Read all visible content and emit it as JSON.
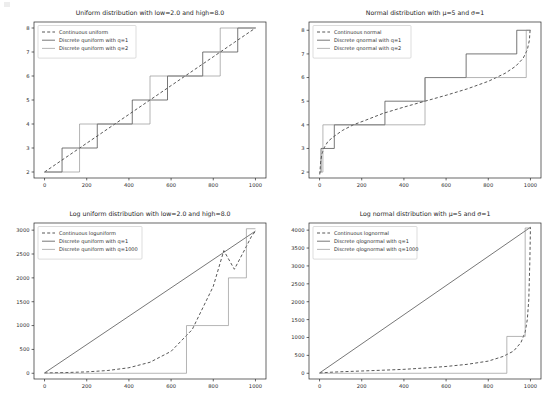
{
  "figure": {
    "width": 550,
    "height": 402,
    "background": "#ffffff",
    "rows": 2,
    "cols": 2
  },
  "style": {
    "continuous_color": "#3a3a3a",
    "q1_color": "#4a4a4a",
    "q2_color": "#8d8d8d",
    "axis_color": "#262626"
  },
  "chart_data": [
    {
      "id": "uniform",
      "type": "line",
      "title": "Uniform distribution with low=2.0 and high=8.0",
      "xlabel": "",
      "ylabel": "",
      "xlim": [
        -50,
        1050
      ],
      "ylim": [
        1.75,
        8.25
      ],
      "xticks": [
        0,
        200,
        400,
        600,
        800,
        1000
      ],
      "yticks": [
        2,
        3,
        4,
        5,
        6,
        7,
        8
      ],
      "grid": false,
      "legend_position": "upper left",
      "series": [
        {
          "name": "Continuous uniform",
          "style": "dashed",
          "color": "#3a3a3a",
          "x": [
            0,
            100,
            200,
            300,
            400,
            500,
            600,
            700,
            800,
            900,
            1000
          ],
          "values": [
            2.0,
            2.6,
            3.2,
            3.8,
            4.4,
            5.0,
            5.6,
            6.2,
            6.8,
            7.4,
            8.0
          ]
        },
        {
          "name": "Discrete quniform with q=1",
          "style": "step",
          "color": "#4a4a4a",
          "step_x": [
            0,
            83,
            83,
            250,
            250,
            416,
            416,
            583,
            583,
            750,
            750,
            916,
            916,
            1000
          ],
          "step_y": [
            2,
            2,
            3,
            3,
            4,
            4,
            5,
            5,
            6,
            6,
            7,
            7,
            8,
            8
          ]
        },
        {
          "name": "Discrete quniform with q=2",
          "style": "step",
          "color": "#8d8d8d",
          "step_x": [
            0,
            166,
            166,
            500,
            500,
            833,
            833,
            1000
          ],
          "step_y": [
            2,
            2,
            4,
            4,
            6,
            6,
            8,
            8
          ]
        }
      ]
    },
    {
      "id": "normal",
      "type": "line",
      "title": "Normal distribution with μ=5 and σ=1",
      "xlabel": "",
      "ylabel": "",
      "xlim": [
        -50,
        1050
      ],
      "ylim": [
        1.75,
        8.35
      ],
      "xticks": [
        0,
        200,
        400,
        600,
        800,
        1000
      ],
      "yticks": [
        2,
        3,
        4,
        5,
        6,
        7,
        8
      ],
      "grid": false,
      "legend_position": "upper left",
      "series": [
        {
          "name": "Continuous normal",
          "style": "dashed",
          "color": "#3a3a3a",
          "x": [
            1,
            5,
            10,
            20,
            40,
            70,
            110,
            160,
            220,
            300,
            400,
            500,
            600,
            700,
            800,
            880,
            930,
            965,
            985,
            995,
            999
          ],
          "values": [
            1.9,
            2.42,
            2.72,
            3.0,
            3.3,
            3.52,
            3.77,
            4.0,
            4.2,
            4.48,
            4.75,
            5.0,
            5.25,
            5.52,
            5.84,
            6.18,
            6.48,
            6.81,
            7.17,
            7.58,
            8.1
          ]
        },
        {
          "name": "Discrete qnormal with q=1",
          "style": "step",
          "color": "#4a4a4a",
          "step_x": [
            0,
            7,
            7,
            70,
            70,
            310,
            310,
            500,
            500,
            695,
            695,
            935,
            935,
            990,
            990,
            1000
          ],
          "step_y": [
            2,
            2,
            3,
            3,
            4,
            4,
            5,
            5,
            6,
            6,
            7,
            7,
            8,
            8,
            8,
            8
          ]
        },
        {
          "name": "Discrete qnormal with q=2",
          "style": "step",
          "color": "#8d8d8d",
          "step_x": [
            0,
            16,
            16,
            500,
            500,
            980,
            980,
            1000
          ],
          "step_y": [
            2,
            2,
            4,
            4,
            6,
            6,
            8,
            8
          ]
        }
      ]
    },
    {
      "id": "loguniform",
      "type": "line",
      "title": "Log uniform distribution with low=2.0 and high=8.0",
      "xlabel": "",
      "ylabel": "",
      "xlim": [
        -50,
        1050
      ],
      "ylim": [
        -120,
        3150
      ],
      "xticks": [
        0,
        200,
        400,
        600,
        800,
        1000
      ],
      "yticks": [
        0,
        500,
        1000,
        1500,
        2000,
        2500,
        3000
      ],
      "grid": false,
      "legend_position": "upper left",
      "series": [
        {
          "name": "Continuous loguniform",
          "style": "dashed",
          "color": "#3a3a3a",
          "x": [
            0,
            100,
            200,
            300,
            400,
            500,
            600,
            700,
            800,
            850,
            900,
            950,
            980,
            1000
          ],
          "values": [
            7.4,
            14.7,
            29.3,
            58.3,
            116,
            231,
            460,
            915,
            1822,
            2571,
            2180,
            2600,
            2860,
            2981
          ]
        },
        {
          "name": "Discrete quniform with q=1",
          "style": "step",
          "color": "#4a4a4a",
          "step_x": [
            0,
            1000
          ],
          "step_y": [
            7,
            2981
          ]
        },
        {
          "name": "Discrete quniform with q=1000",
          "style": "step",
          "color": "#8d8d8d",
          "step_x": [
            0,
            673,
            673,
            872,
            872,
            957,
            957,
            1000
          ],
          "step_y": [
            0,
            0,
            1000,
            1000,
            2000,
            2000,
            3030,
            3030
          ]
        }
      ]
    },
    {
      "id": "lognormal",
      "type": "line",
      "title": "Log normal distribution with μ=5 and σ=1",
      "xlabel": "",
      "ylabel": "",
      "xlim": [
        -50,
        1050
      ],
      "ylim": [
        -160,
        4200
      ],
      "xticks": [
        0,
        200,
        400,
        600,
        800,
        1000
      ],
      "yticks": [
        0,
        500,
        1000,
        1500,
        2000,
        2500,
        3000,
        3500,
        4000
      ],
      "grid": false,
      "legend_position": "upper left",
      "series": [
        {
          "name": "Continuous lognormal",
          "style": "dashed",
          "color": "#3a3a3a",
          "x": [
            0,
            50,
            100,
            200,
            300,
            400,
            500,
            600,
            700,
            800,
            870,
            920,
            955,
            975,
            985,
            992,
            997,
            1000
          ],
          "values": [
            8,
            28,
            42,
            64,
            86,
            110,
            148,
            190,
            250,
            340,
            470,
            620,
            860,
            1150,
            1500,
            2050,
            3100,
            4080
          ]
        },
        {
          "name": "Discrete qlognormal with q=1",
          "style": "step",
          "color": "#4a4a4a",
          "step_x": [
            0,
            1000
          ],
          "step_y": [
            8,
            4080
          ]
        },
        {
          "name": "Discrete qlognormal with q=1000",
          "style": "step",
          "color": "#8d8d8d",
          "step_x": [
            0,
            888,
            888,
            975,
            975,
            1000
          ],
          "step_y": [
            0,
            0,
            1030,
            1030,
            4060,
            4060
          ]
        }
      ]
    }
  ]
}
